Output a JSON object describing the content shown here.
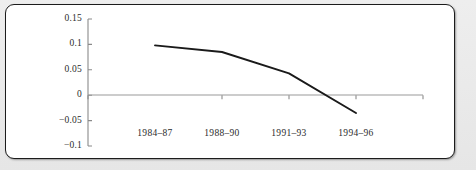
{
  "figure": {
    "clipped_title": "",
    "frame_border_color": "#1c1c1c",
    "page_background": "#e9e9e9",
    "plot_background": "#ffffff"
  },
  "chart_data": {
    "type": "line",
    "title": "",
    "xlabel": "",
    "ylabel": "",
    "categories": [
      "1984–87",
      "1988–90",
      "1991–93",
      "1994–96"
    ],
    "values": [
      0.098,
      0.085,
      0.043,
      -0.035
    ],
    "ylim": [
      -0.1,
      0.15
    ],
    "ytick_labels": [
      "0.15",
      "0.1",
      "0.05",
      "0",
      "−0.05",
      "−0.1"
    ],
    "ytick_values": [
      0.15,
      0.1,
      0.05,
      0,
      -0.05,
      -0.1
    ],
    "grid": false,
    "zero_line": true,
    "legend": "none",
    "line_color": "#1a1a1a",
    "axis_color": "#8a8a8a"
  }
}
